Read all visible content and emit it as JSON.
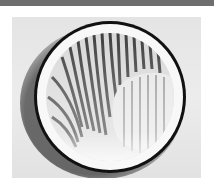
{
  "image": {
    "description": "Grayscale photograph of a circular dish with a thick black rim containing a striped, fingerprint-like fringe pattern with a lighter crescent region on the right",
    "colors": {
      "top_strip": "#6e6e6e",
      "background": "#e8e8e8",
      "rim": "#111111",
      "inner_white": "#f8f8f8",
      "stripes": "#3a3a3a"
    }
  }
}
